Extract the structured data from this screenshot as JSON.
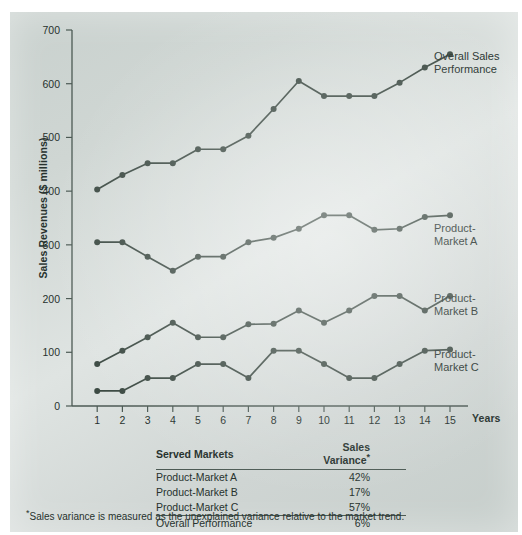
{
  "chart_data": {
    "type": "line",
    "title": "",
    "xlabel": "Years",
    "ylabel": "Sales Revenues ($ millions)",
    "x": [
      1,
      2,
      3,
      4,
      5,
      6,
      7,
      8,
      9,
      10,
      11,
      12,
      13,
      14,
      15
    ],
    "xlim": [
      0,
      15
    ],
    "ylim": [
      0,
      700
    ],
    "yticks": [
      0,
      100,
      200,
      300,
      400,
      500,
      600,
      700
    ],
    "xticks": [
      1,
      2,
      3,
      4,
      5,
      6,
      7,
      8,
      9,
      10,
      11,
      12,
      13,
      14,
      15
    ],
    "grid": false,
    "legend_position": "right-inline-labels",
    "line_color": "#3c4a43",
    "marker": "circle",
    "series": [
      {
        "name": "Overall Sales Performance",
        "label": "Overall Sales\nPerformance",
        "values": [
          403,
          430,
          452,
          452,
          478,
          478,
          503,
          553,
          605,
          577,
          577,
          577,
          602,
          630,
          655
        ]
      },
      {
        "name": "Product-Market A",
        "label": "Product-\nMarket A",
        "values": [
          305,
          305,
          278,
          252,
          278,
          278,
          305,
          313,
          330,
          355,
          355,
          328,
          330,
          352,
          355
        ]
      },
      {
        "name": "Product-Market B",
        "label": "Product-\nMarket B",
        "values": [
          78,
          103,
          128,
          155,
          128,
          128,
          152,
          153,
          178,
          155,
          178,
          205,
          205,
          178,
          205
        ]
      },
      {
        "name": "Product-Market C",
        "label": "Product-\nMarket C",
        "values": [
          28,
          28,
          52,
          52,
          78,
          78,
          52,
          103,
          103,
          78,
          52,
          52,
          78,
          103,
          105
        ]
      }
    ]
  },
  "axes": {
    "y_title": "Sales Revenues ($ millions)",
    "x_title": "Years",
    "y_tick_labels": [
      "700",
      "600",
      "500",
      "400",
      "300",
      "200",
      "100",
      "0"
    ],
    "x_tick_labels": [
      "1",
      "2",
      "3",
      "4",
      "5",
      "6",
      "7",
      "8",
      "9",
      "10",
      "11",
      "12",
      "13",
      "14",
      "15"
    ]
  },
  "series_labels": {
    "overall": "Overall Sales\nPerformance",
    "pm_a": "Product-\nMarket A",
    "pm_b": "Product-\nMarket B",
    "pm_c": "Product-\nMarket C"
  },
  "table": {
    "headers": {
      "market": "Served Markets",
      "variance": "Sales Variance",
      "variance_footnote_marker": "*"
    },
    "rows": [
      {
        "market": "Product-Market A",
        "variance": "42%"
      },
      {
        "market": "Product-Market B",
        "variance": "17%"
      },
      {
        "market": "Product-Market C",
        "variance": "57%"
      }
    ],
    "total": {
      "market": "Overall Performance",
      "variance": "6%"
    }
  },
  "footnote": {
    "marker": "*",
    "text": "Sales variance is measured as the unexplained variance relative to the market trend."
  }
}
